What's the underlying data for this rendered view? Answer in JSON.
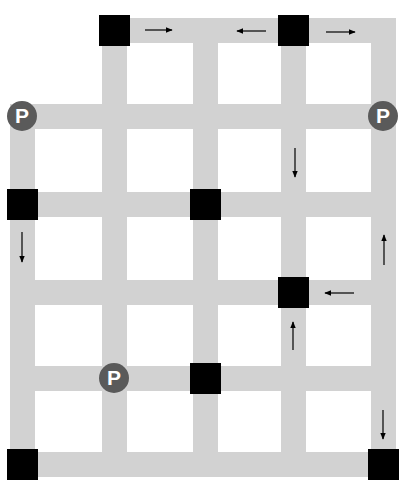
{
  "diagram": {
    "title": "",
    "colors": {
      "road": "#d2d2d2",
      "block": "#000000",
      "parking_fill": "#5a5a5a",
      "parking_text": "#ffffff",
      "arrow": "#000000",
      "background": "#ffffff"
    },
    "grid": {
      "columns": 5,
      "rows": 6,
      "description": "Street grid of 5 vertical and 6 horizontal roads; top road spans columns 2-5, left road starts at row 2"
    },
    "blocks": [
      {
        "col": 2,
        "row": 1
      },
      {
        "col": 4,
        "row": 1
      },
      {
        "col": 1,
        "row": 3
      },
      {
        "col": 3,
        "row": 3
      },
      {
        "col": 4,
        "row": 4
      },
      {
        "col": 3,
        "row": 5
      },
      {
        "col": 1,
        "row": 6
      },
      {
        "col": 5,
        "row": 6
      }
    ],
    "parking": [
      {
        "label": "P",
        "col": 1,
        "row": 2
      },
      {
        "label": "P",
        "col": 5,
        "row": 2
      },
      {
        "label": "P",
        "col": 2,
        "row": 5
      }
    ],
    "arrows": [
      {
        "direction": "right",
        "segment": "row 1 between col 2 and 3"
      },
      {
        "direction": "left",
        "segment": "row 1 between col 3 and 4"
      },
      {
        "direction": "right",
        "segment": "row 1 between col 4 and 5"
      },
      {
        "direction": "down",
        "segment": "col 4 between row 2 and 3"
      },
      {
        "direction": "down",
        "segment": "col 1 between row 3 and 4"
      },
      {
        "direction": "up",
        "segment": "col 5 between row 3 and 4"
      },
      {
        "direction": "left",
        "segment": "row 4 between col 4 and 5"
      },
      {
        "direction": "up",
        "segment": "col 4 between row 4 and 5"
      },
      {
        "direction": "down",
        "segment": "col 5 between row 5 and 6"
      }
    ]
  }
}
